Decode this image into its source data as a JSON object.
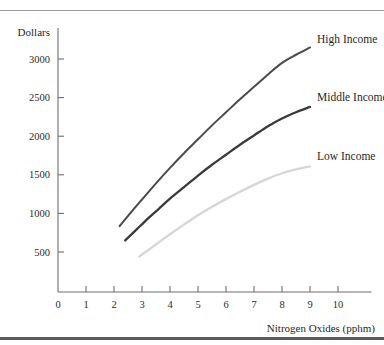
{
  "chart_data": {
    "type": "line",
    "title": "",
    "xlabel": "Nitrogen Oxides (pphm)",
    "ylabel": "Dollars",
    "xlim": [
      0,
      11.2
    ],
    "ylim": [
      0,
      3300
    ],
    "grid": false,
    "legend_position": "right-inline-labels",
    "x_ticks": [
      "0",
      "1",
      "2",
      "3",
      "4",
      "5",
      "6",
      "7",
      "8",
      "9",
      "10"
    ],
    "x_tick_values": [
      0,
      1,
      2,
      3,
      4,
      5,
      6,
      7,
      8,
      9,
      10
    ],
    "y_ticks": [
      "500",
      "1000",
      "1500",
      "2000",
      "2500",
      "3000"
    ],
    "y_tick_values": [
      500,
      1000,
      1500,
      2000,
      2500,
      3000
    ],
    "series": [
      {
        "name": "High Income",
        "color": "#4a4a4a",
        "width": 2.0,
        "label_x": 9.25,
        "label_y": 3210,
        "x": [
          2.2,
          2.6,
          3.0,
          3.5,
          4.0,
          4.5,
          5.0,
          5.5,
          6.0,
          6.5,
          7.0,
          7.5,
          8.0,
          8.5,
          9.0
        ],
        "y": [
          835,
          1010,
          1180,
          1390,
          1590,
          1780,
          1960,
          2140,
          2310,
          2480,
          2640,
          2800,
          2950,
          3055,
          3150
        ]
      },
      {
        "name": "Middle Income",
        "color": "#3a3a3a",
        "width": 2.3,
        "label_x": 9.25,
        "label_y": 2450,
        "x": [
          2.4,
          2.8,
          3.2,
          3.6,
          4.0,
          4.5,
          5.0,
          5.5,
          6.0,
          6.5,
          7.0,
          7.5,
          8.0,
          8.5,
          9.0
        ],
        "y": [
          650,
          790,
          930,
          1060,
          1190,
          1340,
          1490,
          1630,
          1760,
          1890,
          2010,
          2130,
          2230,
          2310,
          2380
        ]
      },
      {
        "name": "Low Income",
        "color": "#d6d6d6",
        "width": 2.3,
        "label_x": 9.25,
        "label_y": 1690,
        "x": [
          2.9,
          3.3,
          3.7,
          4.1,
          4.5,
          5.0,
          5.5,
          6.0,
          6.5,
          7.0,
          7.5,
          8.0,
          8.5,
          9.0
        ],
        "y": [
          440,
          545,
          650,
          755,
          855,
          975,
          1085,
          1185,
          1280,
          1370,
          1450,
          1520,
          1570,
          1610
        ]
      }
    ]
  },
  "axes": {
    "y_axis_title": "Dollars",
    "x_axis_title": "Nitrogen Oxides (pphm)"
  }
}
